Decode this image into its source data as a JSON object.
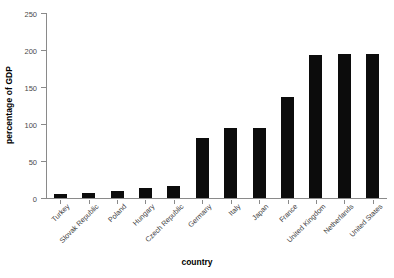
{
  "chart_data": {
    "type": "bar",
    "title": "",
    "xlabel": "country",
    "ylabel": "percentage of GDP",
    "categories": [
      "Turkey",
      "Slovak Republic",
      "Poland",
      "Hungary",
      "Czech Republic",
      "Germany",
      "Italy",
      "Japan",
      "France",
      "United Kingdom",
      "Netherlands",
      "United States"
    ],
    "values": [
      5,
      7,
      10,
      14,
      16,
      81,
      94,
      94,
      136,
      193,
      194,
      194
    ],
    "ylim": [
      0,
      250
    ],
    "yticks": [
      0,
      50,
      100,
      150,
      200,
      250
    ],
    "ytick_labels": [
      "0",
      "50",
      "100",
      "150",
      "200",
      "250"
    ],
    "grid": false,
    "legend": null,
    "bar_color": "#0c0c0c",
    "axis_color": "#8a8a8a",
    "background_color": "#ffffff"
  },
  "figure": {
    "y_axis_title": "percentage of GDP",
    "x_axis_title": "country",
    "watermark": "···"
  }
}
